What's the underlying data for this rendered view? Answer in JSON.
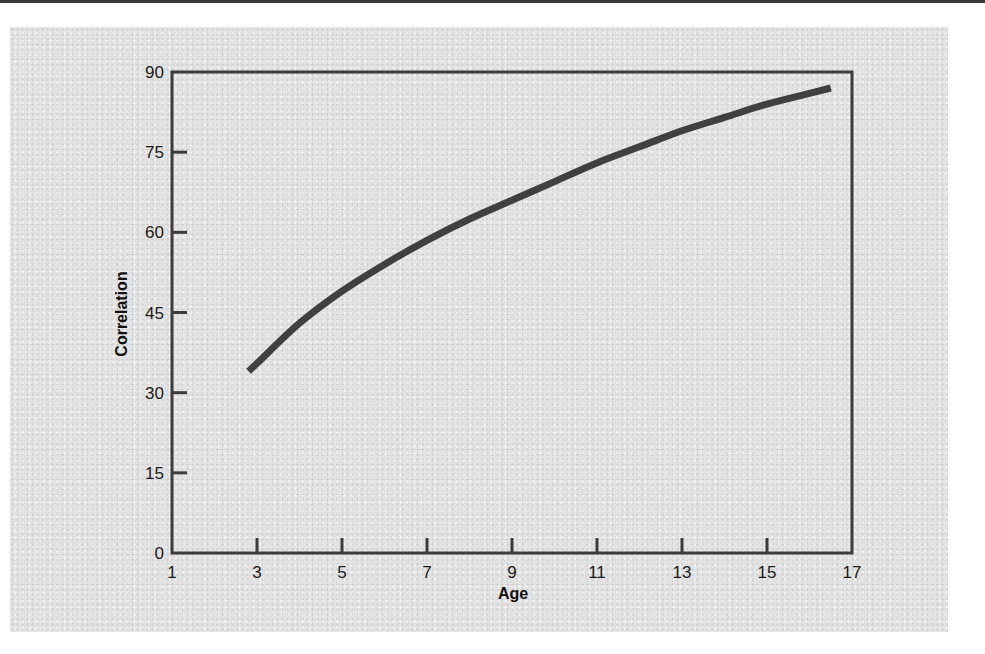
{
  "chart_data": {
    "type": "line",
    "title": "",
    "xlabel": "Age",
    "ylabel": "Correlation",
    "xlim": [
      1,
      17
    ],
    "ylim": [
      0,
      90
    ],
    "xticks": [
      1,
      3,
      5,
      7,
      9,
      11,
      13,
      15,
      17
    ],
    "yticks": [
      0,
      15,
      30,
      45,
      60,
      75,
      90
    ],
    "grid": false,
    "legend": null,
    "series": [
      {
        "name": "Correlation",
        "color": "#404040",
        "x": [
          2.8,
          3,
          4,
          5,
          6,
          7,
          8,
          9,
          10,
          11,
          12,
          13,
          14,
          15,
          16,
          16.5
        ],
        "y": [
          34,
          35.5,
          43,
          49,
          54,
          58.5,
          62.5,
          66,
          69.5,
          73,
          76,
          79,
          81.5,
          84,
          86,
          87
        ]
      }
    ]
  },
  "colors": {
    "panel_background": "#e4e4e4",
    "axis": "#3c3c3c",
    "line": "#404040",
    "text": "#1a1a1a"
  }
}
